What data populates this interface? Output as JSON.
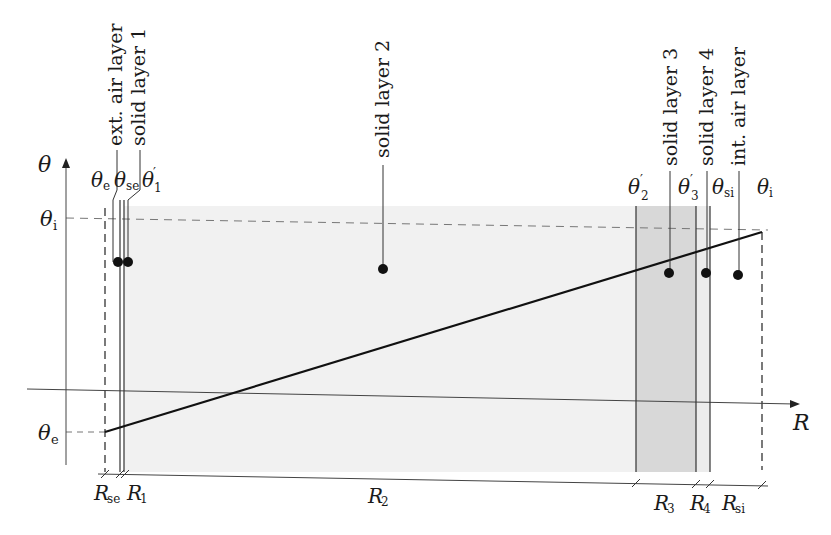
{
  "diagram": {
    "type": "thermal-resistance-layers",
    "axes": {
      "y_label": "θ",
      "x_label": "R"
    },
    "y_ticks": [
      {
        "id": "theta_i",
        "base": "θ",
        "sub": "i"
      },
      {
        "id": "theta_e",
        "base": "θ",
        "sub": "e"
      }
    ],
    "layers": [
      {
        "name": "ext. air layer"
      },
      {
        "name": "solid layer 1"
      },
      {
        "name": "solid layer 2"
      },
      {
        "name": "solid layer 3"
      },
      {
        "name": "solid layer 4"
      },
      {
        "name": "int. air layer"
      }
    ],
    "temps_top": [
      {
        "base": "θ",
        "sub": "e",
        "prime": ""
      },
      {
        "base": "θ",
        "sub": "se",
        "prime": ""
      },
      {
        "base": "θ",
        "sub": "1",
        "prime": "′"
      },
      {
        "base": "θ",
        "sub": "2",
        "prime": "′"
      },
      {
        "base": "θ",
        "sub": "3",
        "prime": "′"
      },
      {
        "base": "θ",
        "sub": "si",
        "prime": ""
      },
      {
        "base": "θ",
        "sub": "i",
        "prime": ""
      }
    ],
    "resistances": [
      {
        "base": "R",
        "sub": "se"
      },
      {
        "base": "R",
        "sub": "1"
      },
      {
        "base": "R",
        "sub": "2"
      },
      {
        "base": "R",
        "sub": "3"
      },
      {
        "base": "R",
        "sub": "4"
      },
      {
        "base": "R",
        "sub": "si"
      }
    ],
    "colors": {
      "shade_light": "#f0f0f0",
      "shade_dark": "#d9d9d9",
      "line": "#111111",
      "thin": "#555555"
    }
  }
}
